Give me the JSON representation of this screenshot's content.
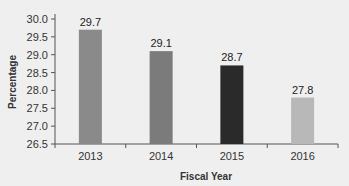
{
  "chart_data": {
    "type": "bar",
    "title": "",
    "xlabel": "Fiscal Year",
    "ylabel": "Percentage",
    "categories": [
      "2013",
      "2014",
      "2015",
      "2016"
    ],
    "values": [
      29.7,
      29.1,
      28.7,
      27.8
    ],
    "value_labels": [
      "29.7",
      "29.1",
      "28.7",
      "27.8"
    ],
    "bar_colors": [
      "#8a8a8a",
      "#7b7b7b",
      "#2a2a2a",
      "#b8b8b8"
    ],
    "ylim": [
      26.5,
      30.0
    ],
    "yticks": [
      "30.0",
      "29.5",
      "29.0",
      "28.5",
      "28.0",
      "27.5",
      "27.0",
      "26.5"
    ],
    "grid": false,
    "legend": null
  }
}
